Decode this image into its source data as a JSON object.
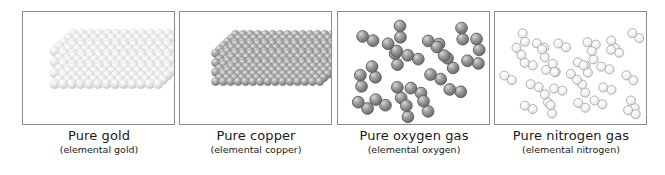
{
  "figure": {
    "background_color": "#ffffff",
    "panel_border_color": "#8c8c8c",
    "text_color": "#1a1a1a"
  },
  "panels": [
    {
      "id": "pure-gold",
      "caption_main": "Pure gold",
      "caption_sub": "(elemental gold)",
      "substance": "gold",
      "representation": "metallic crystal lattice",
      "particle_color": "#e8e8e8",
      "particle_highlight": "#ffffff",
      "particle_shadow": "#c2c2c2",
      "lattice": {
        "columns": 13,
        "rows": 5,
        "layers": 4,
        "sphere_radius": 5.1
      }
    },
    {
      "id": "pure-copper",
      "caption_main": "Pure copper",
      "caption_sub": "(elemental copper)",
      "substance": "copper",
      "representation": "metallic crystal lattice",
      "particle_color": "#9b9b9b",
      "particle_highlight": "#e6e6e6",
      "particle_shadow": "#6e6e6e",
      "lattice": {
        "columns": 15,
        "rows": 6,
        "layers": 4,
        "sphere_radius": 4.4
      }
    },
    {
      "id": "pure-oxygen-gas",
      "caption_main": "Pure oxygen gas",
      "caption_sub": "(elemental oxygen)",
      "substance": "oxygen",
      "representation": "diatomic gas molecules",
      "particle_color": "#8f8f8f",
      "particle_highlight": "#dddddd",
      "particle_shadow": "#5e5e5e",
      "molecule_count": 21,
      "sphere_radius": 6.0,
      "molecules": [
        {
          "x": 30,
          "y": 27,
          "angle": 22
        },
        {
          "x": 63,
          "y": 20,
          "angle": 88
        },
        {
          "x": 97,
          "y": 31,
          "angle": 16
        },
        {
          "x": 126,
          "y": 22,
          "angle": 84
        },
        {
          "x": 36,
          "y": 61,
          "angle": 72
        },
        {
          "x": 59,
          "y": 48,
          "angle": 78
        },
        {
          "x": 76,
          "y": 46,
          "angle": 20
        },
        {
          "x": 114,
          "y": 52,
          "angle": 60
        },
        {
          "x": 137,
          "y": 51,
          "angle": 14
        },
        {
          "x": 99,
          "y": 66,
          "angle": 24
        },
        {
          "x": 62,
          "y": 82,
          "angle": 70
        },
        {
          "x": 79,
          "y": 80,
          "angle": 26
        },
        {
          "x": 119,
          "y": 80,
          "angle": 12
        },
        {
          "x": 43,
          "y": 92,
          "angle": 30
        },
        {
          "x": 25,
          "y": 95,
          "angle": 34
        },
        {
          "x": 89,
          "y": 96,
          "angle": 66
        },
        {
          "x": 70,
          "y": 101,
          "angle": 82
        },
        {
          "x": 142,
          "y": 33,
          "angle": 76
        },
        {
          "x": 23,
          "y": 70,
          "angle": 84
        },
        {
          "x": 104,
          "y": 40,
          "angle": 50
        },
        {
          "x": 55,
          "y": 36,
          "angle": 40
        }
      ]
    },
    {
      "id": "pure-nitrogen-gas",
      "caption_main": "Pure nitrogen gas",
      "caption_sub": "(elemental nitrogen)",
      "substance": "nitrogen",
      "representation": "diatomic gas molecules",
      "particle_color": "#f2f2f2",
      "particle_highlight": "#ffffff",
      "particle_shadow": "#b4b4b4",
      "particle_outline": "#a8a8a8",
      "molecule_count": 30,
      "sphere_radius": 4.6,
      "molecules": [
        {
          "x": 29,
          "y": 26,
          "angle": 74
        },
        {
          "x": 46,
          "y": 34,
          "angle": 30
        },
        {
          "x": 49,
          "y": 42,
          "angle": 72
        },
        {
          "x": 68,
          "y": 34,
          "angle": 26
        },
        {
          "x": 98,
          "y": 32,
          "angle": 16
        },
        {
          "x": 99,
          "y": 44,
          "angle": 78
        },
        {
          "x": 120,
          "y": 33,
          "angle": 62
        },
        {
          "x": 122,
          "y": 40,
          "angle": 20
        },
        {
          "x": 143,
          "y": 24,
          "angle": 36
        },
        {
          "x": 34,
          "y": 53,
          "angle": 18
        },
        {
          "x": 60,
          "y": 57,
          "angle": 70
        },
        {
          "x": 56,
          "y": 60,
          "angle": 14
        },
        {
          "x": 88,
          "y": 53,
          "angle": 24
        },
        {
          "x": 92,
          "y": 58,
          "angle": 60
        },
        {
          "x": 112,
          "y": 57,
          "angle": 18
        },
        {
          "x": 13,
          "y": 67,
          "angle": 32
        },
        {
          "x": 137,
          "y": 67,
          "angle": 36
        },
        {
          "x": 40,
          "y": 75,
          "angle": 20
        },
        {
          "x": 64,
          "y": 79,
          "angle": 14
        },
        {
          "x": 90,
          "y": 78,
          "angle": 70
        },
        {
          "x": 114,
          "y": 78,
          "angle": 16
        },
        {
          "x": 52,
          "y": 88,
          "angle": 68
        },
        {
          "x": 34,
          "y": 97,
          "angle": 24
        },
        {
          "x": 57,
          "y": 99,
          "angle": 80
        },
        {
          "x": 88,
          "y": 95,
          "angle": 34
        },
        {
          "x": 105,
          "y": 92,
          "angle": 26
        },
        {
          "x": 140,
          "y": 94,
          "angle": 64
        },
        {
          "x": 139,
          "y": 102,
          "angle": 28
        },
        {
          "x": 80,
          "y": 66,
          "angle": 44
        },
        {
          "x": 24,
          "y": 40,
          "angle": 56
        }
      ]
    }
  ]
}
